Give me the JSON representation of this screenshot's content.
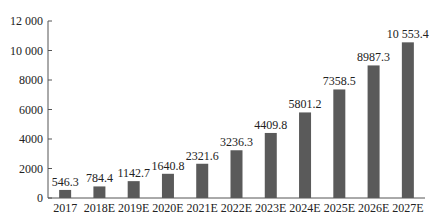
{
  "chart_data": {
    "type": "bar",
    "title": "",
    "xlabel": "",
    "ylabel": "",
    "categories": [
      "2017",
      "2018E",
      "2019E",
      "2020E",
      "2021E",
      "2022E",
      "2023E",
      "2024E",
      "2025E",
      "2026E",
      "2027E"
    ],
    "values": [
      546.3,
      784.4,
      1142.7,
      1640.8,
      2321.6,
      3236.3,
      4409.8,
      5801.2,
      7358.5,
      8987.3,
      10553.4
    ],
    "value_labels": [
      "546.3",
      "784.4",
      "1142.7",
      "1640.8",
      "2321.6",
      "3236.3",
      "4409.8",
      "5801.2",
      "7358.5",
      "8987.3",
      "10 553.4"
    ],
    "ylim": [
      0,
      12000
    ],
    "yticks": [
      0,
      2000,
      4000,
      6000,
      8000,
      10000,
      12000
    ],
    "ytick_labels": [
      "0",
      "2000",
      "4000",
      "6000",
      "8000",
      "10 000",
      "12 000"
    ],
    "grid": false,
    "legend": null,
    "colors": {
      "bar": "#5a5a5a",
      "axis": "#555555",
      "text": "#222222"
    }
  }
}
